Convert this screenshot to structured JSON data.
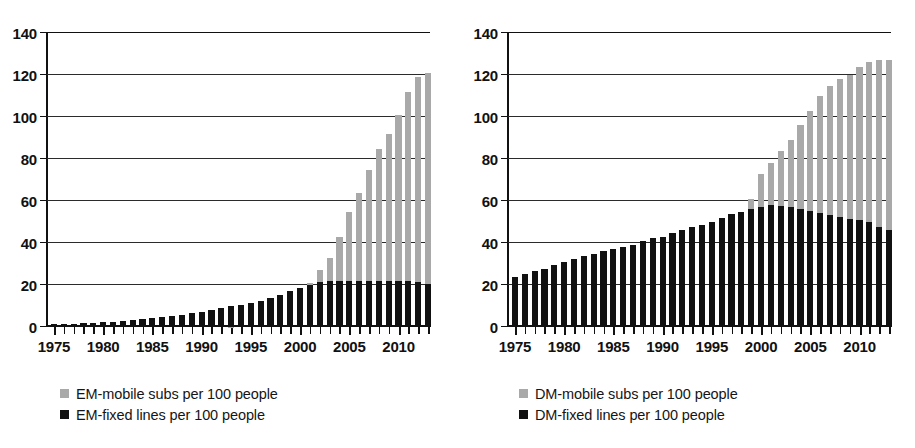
{
  "figure": {
    "background": "#ffffff",
    "bar_colors": {
      "mobile": "#a9a9a9",
      "fixed": "#111111"
    }
  },
  "panels": [
    {
      "id": "em",
      "legend": [
        {
          "key": "mobile",
          "label": "EM-mobile subs per 100 people",
          "color": "#a9a9a9"
        },
        {
          "key": "fixed",
          "label": "EM-fixed lines per 100 people",
          "color": "#111111"
        }
      ]
    },
    {
      "id": "dm",
      "legend": [
        {
          "key": "mobile",
          "label": "DM-mobile subs per 100 people",
          "color": "#a9a9a9"
        },
        {
          "key": "fixed",
          "label": "DM-fixed lines per 100 people",
          "color": "#111111"
        }
      ]
    }
  ],
  "chart_data": [
    {
      "type": "bar",
      "id": "em",
      "title": "",
      "xlabel": "",
      "ylabel": "",
      "ylim": [
        0,
        140
      ],
      "yticks": [
        0,
        20,
        40,
        60,
        80,
        100,
        120,
        140
      ],
      "ytick_labels": [
        "0",
        "20",
        "40",
        "60",
        "80",
        "100",
        "120",
        "140"
      ],
      "grid": true,
      "legend_position": "below-left",
      "overlap": "overlapping",
      "x": [
        1975,
        1976,
        1977,
        1978,
        1979,
        1980,
        1981,
        1982,
        1983,
        1984,
        1985,
        1986,
        1987,
        1988,
        1989,
        1990,
        1991,
        1992,
        1993,
        1994,
        1995,
        1996,
        1997,
        1998,
        1999,
        2000,
        2001,
        2002,
        2003,
        2004,
        2005,
        2006,
        2007,
        2008,
        2009,
        2010,
        2011,
        2012,
        2013
      ],
      "xtick_labels": [
        "1975",
        "1980",
        "1985",
        "1990",
        "1995",
        "2000",
        "2005",
        "2010"
      ],
      "xtick_values": [
        1975,
        1980,
        1985,
        1990,
        1995,
        2000,
        2005,
        2010
      ],
      "series": [
        {
          "name": "EM-mobile subs per 100 people",
          "key": "mobile",
          "color": "#a9a9a9",
          "values": [
            0,
            0,
            0,
            0,
            0,
            0,
            0,
            0,
            0,
            0,
            0,
            0,
            0,
            0,
            0,
            0,
            0,
            0,
            0.2,
            0.4,
            0.8,
            1.5,
            4,
            7,
            11,
            17,
            21,
            27,
            33,
            43,
            55,
            64,
            75,
            85,
            92,
            101,
            112,
            119,
            121
          ]
        },
        {
          "name": "EM-fixed lines per 100 people",
          "key": "fixed",
          "color": "#111111",
          "values": [
            1.2,
            1.3,
            1.5,
            1.7,
            1.9,
            2.2,
            2.6,
            3,
            3.4,
            3.8,
            4.3,
            4.8,
            5.3,
            5.9,
            6.5,
            7.2,
            8,
            9,
            9.8,
            10.6,
            11.5,
            12.5,
            13.6,
            15.3,
            17.2,
            18.5,
            20,
            21.5,
            21.8,
            22,
            22,
            22,
            22,
            22,
            22,
            22,
            22,
            21.5,
            20.5
          ]
        }
      ]
    },
    {
      "type": "bar",
      "id": "dm",
      "title": "",
      "xlabel": "",
      "ylabel": "",
      "ylim": [
        0,
        140
      ],
      "yticks": [
        0,
        20,
        40,
        60,
        80,
        100,
        120,
        140
      ],
      "ytick_labels": [
        "0",
        "20",
        "40",
        "60",
        "80",
        "100",
        "120",
        "140"
      ],
      "grid": true,
      "legend_position": "below-left",
      "overlap": "overlapping",
      "x": [
        1975,
        1976,
        1977,
        1978,
        1979,
        1980,
        1981,
        1982,
        1983,
        1984,
        1985,
        1986,
        1987,
        1988,
        1989,
        1990,
        1991,
        1992,
        1993,
        1994,
        1995,
        1996,
        1997,
        1998,
        1999,
        2000,
        2001,
        2002,
        2003,
        2004,
        2005,
        2006,
        2007,
        2008,
        2009,
        2010,
        2011,
        2012,
        2013
      ],
      "xtick_labels": [
        "1975",
        "1980",
        "1985",
        "1990",
        "1995",
        "2000",
        "2005",
        "2010"
      ],
      "xtick_values": [
        1975,
        1980,
        1985,
        1990,
        1995,
        2000,
        2005,
        2010
      ],
      "series": [
        {
          "name": "DM-mobile subs per 100 people",
          "key": "mobile",
          "color": "#a9a9a9",
          "values": [
            0,
            0,
            0,
            0,
            0,
            0,
            0,
            0,
            0,
            0,
            0,
            0,
            0,
            0,
            0.3,
            0.6,
            1.2,
            2.5,
            5,
            8.5,
            14,
            21,
            30,
            42,
            61,
            73,
            78,
            84,
            89,
            96,
            103,
            110,
            115,
            118,
            120,
            124,
            126,
            127,
            127
          ]
        },
        {
          "name": "DM-fixed lines per 100 people",
          "key": "fixed",
          "color": "#111111",
          "values": [
            24,
            25.3,
            26.5,
            27.8,
            29.4,
            31,
            32.5,
            33.8,
            34.8,
            36,
            37,
            38.2,
            39.2,
            41,
            42.3,
            43,
            44.8,
            46,
            47.5,
            48.8,
            50,
            52,
            53.8,
            55,
            56,
            57,
            58,
            57.8,
            57,
            56.2,
            55.3,
            54.3,
            53.2,
            52.4,
            51.3,
            51,
            50.2,
            47.5,
            46.2
          ]
        }
      ]
    }
  ]
}
